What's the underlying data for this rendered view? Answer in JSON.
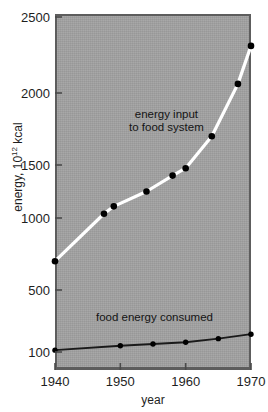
{
  "chart_data": {
    "type": "line",
    "title": "",
    "xlabel": "year",
    "ylabel": "energy, 10^12 kcal",
    "ylabel_prefix": "energy, 10",
    "ylabel_exponent": "12",
    "ylabel_suffix": " kcal",
    "xlim": [
      1940,
      1970
    ],
    "ylim": [
      100,
      2500
    ],
    "xticks": [
      1940,
      1950,
      1960,
      1970
    ],
    "xtick_labels": [
      "1940",
      "1950",
      "1960",
      "1970"
    ],
    "yticks": [
      100,
      500,
      1000,
      1500,
      2000,
      2500
    ],
    "ytick_labels": [
      "100",
      "500",
      "1000",
      "1500",
      "2000",
      "2500"
    ],
    "grid": false,
    "legend_position": "inline-annotations",
    "plot_background_color": "#a2a2a2",
    "series": [
      {
        "name": "energy input to food system",
        "line_color": "#ffffff",
        "marker_color": "#000000",
        "label_text_line1": "energy input",
        "label_text_line2": "to food system",
        "x": [
          1940,
          1947.5,
          1949,
          1954,
          1958,
          1960,
          1964,
          1968,
          1970
        ],
        "values": [
          700,
          1040,
          1110,
          1250,
          1400,
          1470,
          1700,
          2060,
          2310
        ]
      },
      {
        "name": "food energy consumed",
        "line_color": "#1a1a1a",
        "marker_color": "#000000",
        "label_text": "food energy consumed",
        "x": [
          1940,
          1950,
          1955,
          1960,
          1965,
          1970
        ],
        "values": [
          112,
          140,
          152,
          163,
          186,
          215
        ]
      }
    ]
  },
  "axes": {
    "x_title": "year",
    "x_tick_labels": [
      "1940",
      "1950",
      "1960",
      "1970"
    ],
    "y_tick_labels": [
      "2500",
      "2000",
      "1500",
      "1000",
      "500",
      "100"
    ]
  },
  "annotations": {
    "upper_line1": "energy input",
    "upper_line2": "to food system",
    "lower": "food energy consumed"
  }
}
